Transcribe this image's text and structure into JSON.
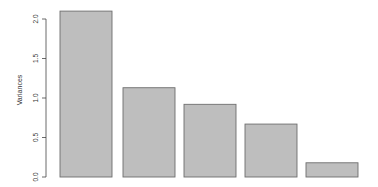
{
  "chart_data": {
    "type": "bar",
    "title": "",
    "xlabel": "",
    "ylabel": "Variances",
    "categories": [
      "PC1",
      "PC2",
      "PC3",
      "PC4",
      "PC5"
    ],
    "show_category_labels": false,
    "values": [
      2.1,
      1.13,
      0.92,
      0.67,
      0.18
    ],
    "ylim": [
      0,
      2.1
    ],
    "yticks": [
      0.0,
      0.5,
      1.0,
      1.5,
      2.0
    ],
    "ytick_labels": [
      "0.0",
      "0.5",
      "1.0",
      "1.5",
      "2.0"
    ],
    "grid": false,
    "legend": null,
    "bar_fill": "#bebebe",
    "bar_stroke": "#6e6e6e"
  }
}
